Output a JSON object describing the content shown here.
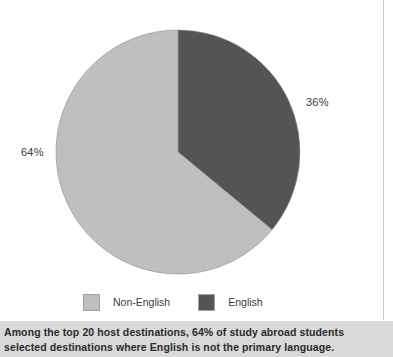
{
  "chart_data": {
    "type": "pie",
    "title": "",
    "categories": [
      "Non-English",
      "English"
    ],
    "values": [
      64,
      36
    ],
    "value_labels": [
      "64%",
      "36%"
    ],
    "colors": [
      "#bfbfbf",
      "#545454"
    ],
    "legend_position": "bottom",
    "start_angle_deg": 0,
    "direction": "clockwise",
    "grid": false,
    "slices": [
      {
        "label": "English",
        "value": 36,
        "value_label": "36%",
        "color": "#545454"
      },
      {
        "label": "Non-English",
        "value": 64,
        "value_label": "64%",
        "color": "#bfbfbf"
      }
    ]
  },
  "legend": {
    "items": [
      {
        "label": "Non-English",
        "color": "#bfbfbf"
      },
      {
        "label": "English",
        "color": "#545454"
      }
    ]
  },
  "labels": {
    "english_pct": "36%",
    "non_english_pct": "64%"
  },
  "caption": {
    "line1": "Among the top 20 host destinations, 64% of study abroad students",
    "line2": "selected destinations where English is not the primary language."
  }
}
